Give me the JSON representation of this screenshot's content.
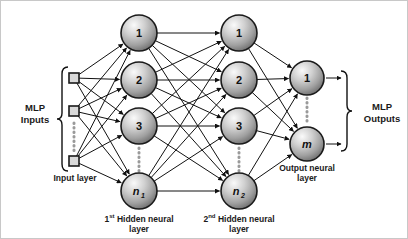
{
  "figure": {
    "background": "#ffffff",
    "border_color": "#c8c8c8",
    "width": 408,
    "height": 239
  },
  "labels": {
    "mlp_inputs_line1": "MLP",
    "mlp_inputs_line2": "Inputs",
    "mlp_outputs_line1": "MLP",
    "mlp_outputs_line2": "Outputs",
    "input_layer": "Input layer",
    "hidden1_line1": "1st Hidden neural",
    "hidden1_sup": "st",
    "hidden1_num": "1",
    "hidden1_rest": " Hidden neural",
    "hidden1_line2": "layer",
    "hidden2_num": "2",
    "hidden2_sup": "nd",
    "hidden2_rest": " Hidden neural",
    "hidden2_line2": "layer",
    "output_layer_line1": "Output neural",
    "output_layer_line2": "layer"
  },
  "layers": {
    "input": {
      "name": "Input layer",
      "node_shape": "square",
      "cx": 73,
      "size": 10,
      "nodes": [
        {
          "id": "in-1",
          "cy": 77,
          "label": ""
        },
        {
          "id": "in-2",
          "cy": 110,
          "label": ""
        },
        {
          "id": "in-3",
          "cy": 160,
          "label": ""
        }
      ],
      "ellipsis": {
        "x": 73,
        "y1": 122,
        "y2": 150
      }
    },
    "hidden1": {
      "name": "1st Hidden neural layer",
      "cx": 138,
      "radius": 18,
      "nodes": [
        {
          "id": "h1-1",
          "cy": 32,
          "label": "1",
          "italic": false,
          "sub": ""
        },
        {
          "id": "h1-2",
          "cy": 79,
          "label": "2",
          "italic": false,
          "sub": ""
        },
        {
          "id": "h1-3",
          "cy": 125,
          "label": "3",
          "italic": false,
          "sub": ""
        },
        {
          "id": "h1-n",
          "cy": 190,
          "label": "n",
          "italic": true,
          "sub": "1"
        }
      ],
      "ellipsis": {
        "x": 138,
        "y1": 147,
        "y2": 170
      }
    },
    "hidden2": {
      "name": "2nd Hidden neural layer",
      "cx": 238,
      "radius": 18,
      "nodes": [
        {
          "id": "h2-1",
          "cy": 32,
          "label": "1",
          "italic": false,
          "sub": ""
        },
        {
          "id": "h2-2",
          "cy": 79,
          "label": "2",
          "italic": false,
          "sub": ""
        },
        {
          "id": "h2-3",
          "cy": 125,
          "label": "3",
          "italic": false,
          "sub": ""
        },
        {
          "id": "h2-n",
          "cy": 190,
          "label": "n",
          "italic": true,
          "sub": "2"
        }
      ],
      "ellipsis": {
        "x": 238,
        "y1": 147,
        "y2": 170
      }
    },
    "output": {
      "name": "Output neural layer",
      "cx": 306,
      "radius": 17,
      "nodes": [
        {
          "id": "out-1",
          "cy": 77,
          "label": "1",
          "italic": false,
          "sub": ""
        },
        {
          "id": "out-m",
          "cy": 143,
          "label": "m",
          "italic": true,
          "sub": ""
        }
      ],
      "ellipsis": {
        "x": 306,
        "y1": 97,
        "y2": 123
      }
    }
  },
  "colors": {
    "node_fill_light": "#f2f2f2",
    "node_fill_mid": "#b4b4b4",
    "node_fill_dark": "#6e6e6e",
    "node_stroke": "#1a1a1a",
    "edge": "#111111",
    "text": "#1a1a1a",
    "dotted": "#9a9a9a",
    "square_fill": "#d9d9d9"
  },
  "braces": {
    "input_brace": {
      "x": 60,
      "y_top": 66,
      "y_bottom": 170,
      "direction": "right"
    },
    "output_brace": {
      "x": 347,
      "y_top": 70,
      "y_bottom": 150,
      "direction": "left"
    }
  },
  "connections": {
    "input_to_hidden1": "fully-connected",
    "hidden1_to_hidden2": "fully-connected",
    "hidden2_to_output": "fully-connected",
    "arrowheads": true
  }
}
